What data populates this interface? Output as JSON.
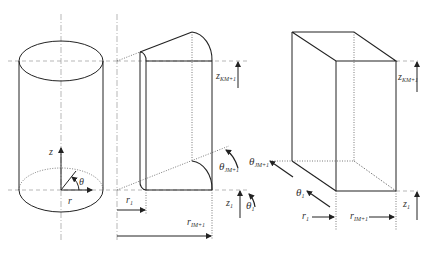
{
  "figure": {
    "panels": [
      {
        "name": "cylinder",
        "labels": {
          "z": "z",
          "r": "r",
          "theta": "θ"
        }
      },
      {
        "name": "cylindrical-cell",
        "labels": {
          "z_top": {
            "base": "z",
            "sub": "KM+1"
          },
          "z_bottom": {
            "base": "z",
            "sub": "1"
          },
          "r_inner": {
            "base": "r",
            "sub": "1"
          },
          "r_outer": {
            "base": "r",
            "sub": "IM+1"
          },
          "theta_outer": {
            "base": "θ",
            "sub": "JM+1"
          },
          "theta_inner": {
            "base": "θ",
            "sub": "1"
          }
        }
      },
      {
        "name": "computational-box",
        "labels": {
          "z_top": {
            "base": "z",
            "sub": "KM+1"
          },
          "z_bottom": {
            "base": "z",
            "sub": "1"
          },
          "r_inner": {
            "base": "r",
            "sub": "1"
          },
          "r_outer": {
            "base": "r",
            "sub": "IM+1"
          },
          "theta_outer": {
            "base": "θ",
            "sub": "JM+1"
          },
          "theta_inner": {
            "base": "θ",
            "sub": "1"
          }
        }
      }
    ],
    "colors": {
      "line": "#222222",
      "guide": "#888888",
      "background": "#ffffff"
    }
  }
}
